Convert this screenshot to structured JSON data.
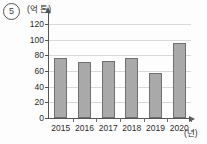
{
  "problem": {
    "number": "5"
  },
  "axes": {
    "y_unit_label": "(억 톤)",
    "x_unit_label": "(년)"
  },
  "chart_data": {
    "type": "bar",
    "title": "",
    "xlabel": "(년)",
    "ylabel": "(억 톤)",
    "categories": [
      "2015",
      "2016",
      "2017",
      "2018",
      "2019",
      "2020"
    ],
    "values": [
      77,
      71,
      73,
      76,
      57,
      96
    ],
    "ylim": [
      0,
      130
    ],
    "yticks": [
      0,
      20,
      40,
      60,
      80,
      100,
      120
    ],
    "ytick_labels": [
      "0",
      "20",
      "40",
      "60",
      "80",
      "100",
      "120"
    ],
    "grid": true,
    "legend": false,
    "bar_color": "#a9a9a9",
    "bar_border_color": "#6f6f6f",
    "gridline_color": "#d8d8d8",
    "axis_color": "#555555"
  }
}
